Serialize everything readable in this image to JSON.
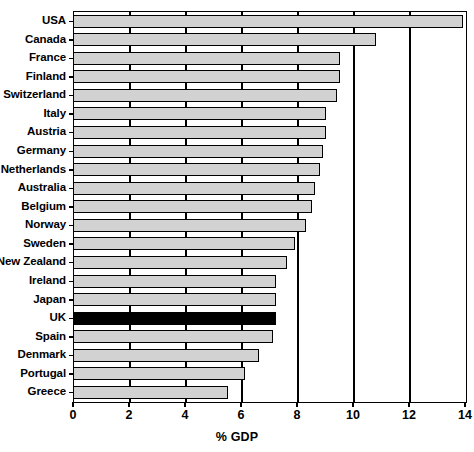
{
  "chart_data": {
    "type": "bar",
    "orientation": "horizontal",
    "title": "",
    "xlabel": "% GDP",
    "ylabel": "",
    "xlim": [
      0,
      14
    ],
    "xticks": [
      0,
      2,
      4,
      6,
      8,
      10,
      12,
      14
    ],
    "xtick_labels": [
      "0",
      "2",
      "4",
      "6",
      "8",
      "10",
      "12",
      "14"
    ],
    "grid": true,
    "grid_axis": "x",
    "legend": false,
    "categories": [
      "USA",
      "Canada",
      "France",
      "Finland",
      "Switzerland",
      "Italy",
      "Austria",
      "Germany",
      "Netherlands",
      "Australia",
      "Belgium",
      "Norway",
      "Sweden",
      "New Zealand",
      "Ireland",
      "Japan",
      "UK",
      "Spain",
      "Denmark",
      "Portugal",
      "Greece"
    ],
    "values": [
      13.9,
      10.8,
      9.5,
      9.5,
      9.4,
      9.0,
      9.0,
      8.9,
      8.8,
      8.6,
      8.5,
      8.3,
      7.9,
      7.6,
      7.2,
      7.2,
      7.2,
      7.1,
      6.6,
      6.1,
      5.5
    ],
    "highlight_category": "UK",
    "colors": {
      "bar_fill": "#d2d2d2",
      "bar_edge": "#000000",
      "highlight_fill": "#000000",
      "axis": "#000000",
      "background": "#ffffff"
    }
  }
}
